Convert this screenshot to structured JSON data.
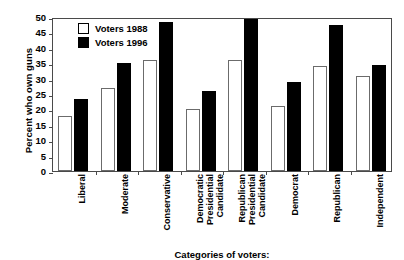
{
  "chart_data": {
    "type": "bar",
    "title": "",
    "xlabel": "Categories of voters:",
    "ylabel": "Percent who own guns",
    "ylim": [
      0,
      50
    ],
    "yticks": [
      0,
      5,
      10,
      15,
      20,
      25,
      30,
      35,
      40,
      45,
      50
    ],
    "grid": false,
    "legend_position": "top-left-inside",
    "categories": [
      "Liberal",
      "Moderate",
      "Conservative",
      "Democratic Presidential Candidate",
      "Republican Presidential Candidate",
      "Democrat",
      "Republican",
      "Independent"
    ],
    "category_lines": [
      [
        "Liberal"
      ],
      [
        "Moderate"
      ],
      [
        "Conservative"
      ],
      [
        "Democratic",
        "Presidential",
        "Candidate"
      ],
      [
        "Republican",
        "Presidential",
        "Candidate"
      ],
      [
        "Democrat"
      ],
      [
        "Republican"
      ],
      [
        "Independent"
      ]
    ],
    "series": [
      {
        "name": "Voters 1988",
        "color": "#ffffff",
        "edge_color": "#6b6b6b",
        "values": [
          18,
          27,
          36,
          20,
          36,
          21,
          34,
          31
        ]
      },
      {
        "name": "Voters 1996",
        "color": "#000000",
        "edge_color": "#000000",
        "values": [
          23.5,
          35,
          48.5,
          26,
          49.5,
          29,
          47.5,
          34.5
        ]
      }
    ]
  },
  "legend": {
    "items": [
      {
        "label": "Voters 1988"
      },
      {
        "label": "Voters 1996"
      }
    ]
  },
  "colors": {
    "series_1988": "#ffffff",
    "series_1996": "#000000",
    "axis": "#4a4a4a",
    "background": "#ffffff"
  }
}
